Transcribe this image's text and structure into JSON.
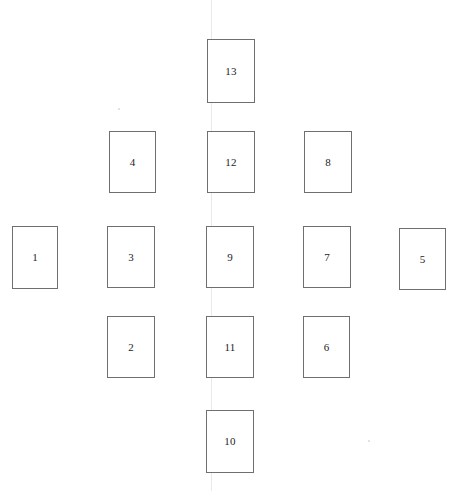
{
  "diagram": {
    "type": "card-spread-diagram",
    "background_color": "#ffffff",
    "card_fill_color": "#ffffff",
    "card_border_color": "#6e6e73",
    "label_color": "#232326",
    "scan_line_color": "#e9e9ec",
    "canvas": {
      "width": 456,
      "height": 491
    }
  },
  "artifacts": {
    "scan_lines": [
      {
        "name": "faint-vertical-scan-line",
        "x": 211
      }
    ],
    "specks": [
      {
        "name": "faint-speck-upper-left",
        "x": 118,
        "y": 108
      },
      {
        "name": "faint-speck-lower-right",
        "x": 368,
        "y": 440
      }
    ]
  },
  "cards": [
    {
      "label": "1",
      "x": 12,
      "y": 226,
      "width": 46,
      "height": 63
    },
    {
      "label": "2",
      "x": 107,
      "y": 316,
      "width": 48,
      "height": 62
    },
    {
      "label": "3",
      "x": 107,
      "y": 226,
      "width": 48,
      "height": 62
    },
    {
      "label": "4",
      "x": 109,
      "y": 131,
      "width": 47,
      "height": 62
    },
    {
      "label": "5",
      "x": 399,
      "y": 228,
      "width": 47,
      "height": 62
    },
    {
      "label": "6",
      "x": 303,
      "y": 316,
      "width": 47,
      "height": 62
    },
    {
      "label": "7",
      "x": 303,
      "y": 226,
      "width": 48,
      "height": 62
    },
    {
      "label": "8",
      "x": 304,
      "y": 131,
      "width": 48,
      "height": 62
    },
    {
      "label": "9",
      "x": 206,
      "y": 226,
      "width": 48,
      "height": 62
    },
    {
      "label": "10",
      "x": 206,
      "y": 410,
      "width": 48,
      "height": 63
    },
    {
      "label": "11",
      "x": 206,
      "y": 316,
      "width": 48,
      "height": 62
    },
    {
      "label": "12",
      "x": 207,
      "y": 131,
      "width": 48,
      "height": 62
    },
    {
      "label": "13",
      "x": 207,
      "y": 39,
      "width": 48,
      "height": 64
    }
  ]
}
